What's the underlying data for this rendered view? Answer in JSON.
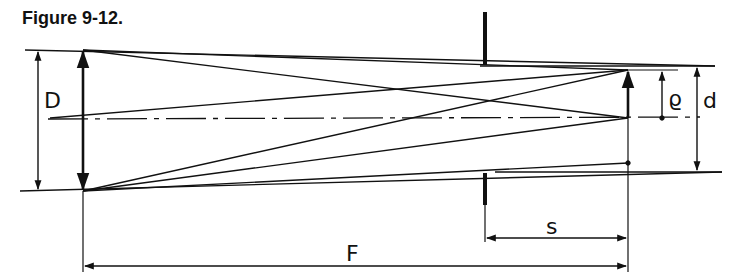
{
  "figure": {
    "title": "Figure 9-12.",
    "labels": {
      "aperture_diameter": "D",
      "image_radius": "ϱ",
      "stop_diameter": "d",
      "stop_distance": "s",
      "focal_length": "F"
    }
  }
}
